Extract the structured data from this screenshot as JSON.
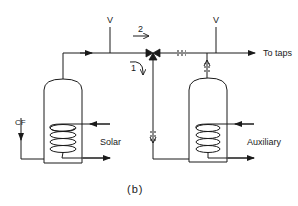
{
  "figure": {
    "caption": "(b)",
    "labels": {
      "vent_left": "V",
      "vent_right": "V",
      "flow_path_2": "2",
      "flow_path_1": "1",
      "cold_feed": "CF",
      "solar": "Solar",
      "auxiliary": "Auxiliary",
      "outlet": "To taps"
    },
    "components": [
      {
        "name": "solar-preheat-tank",
        "coil": "Solar"
      },
      {
        "name": "auxiliary-tank",
        "coil": "Auxiliary"
      },
      {
        "name": "three-way-valve"
      }
    ],
    "colors": {
      "line": "#1a1a1a",
      "background": "#ffffff"
    }
  }
}
